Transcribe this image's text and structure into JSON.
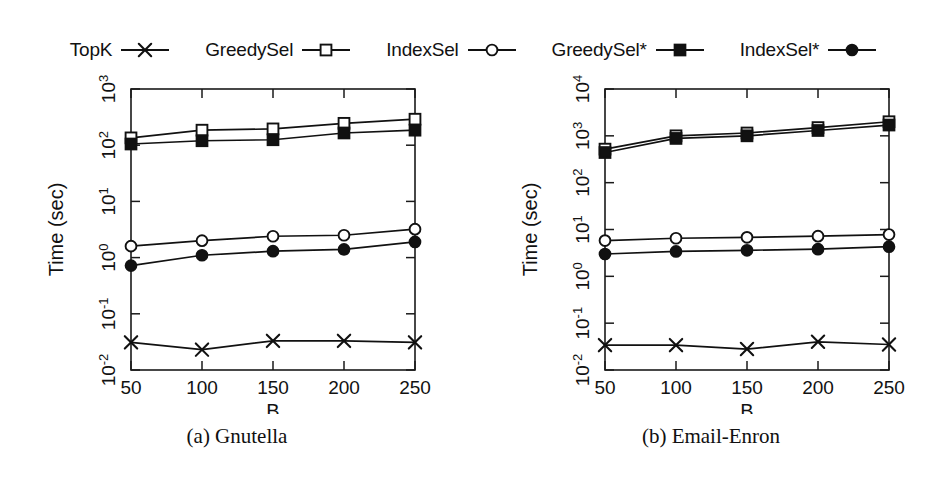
{
  "figure": {
    "background": "#ffffff",
    "ink_color": "#111111"
  },
  "legend": {
    "position": "top",
    "entries": [
      {
        "label": "TopK",
        "marker": "cross",
        "filled": false
      },
      {
        "label": "GreedySel",
        "marker": "square",
        "filled": false
      },
      {
        "label": "IndexSel",
        "marker": "circle",
        "filled": false
      },
      {
        "label": "GreedySel*",
        "marker": "square-solid",
        "filled": true
      },
      {
        "label": "IndexSel*",
        "marker": "circle-solid",
        "filled": true
      }
    ]
  },
  "captions": {
    "left": "(a) Gnutella",
    "right": "(b) Email-Enron"
  },
  "chart_data": [
    {
      "type": "line",
      "panel": "a",
      "title": "(a) Gnutella",
      "xlabel": "B",
      "ylabel": "Time (sec)",
      "xscale": "linear",
      "yscale": "log",
      "grid": false,
      "legend_position": "top",
      "categories": [
        50,
        100,
        150,
        200,
        250
      ],
      "x": [
        50,
        100,
        150,
        200,
        250
      ],
      "xlim": [
        50,
        250
      ],
      "xticks": [
        50,
        100,
        150,
        200,
        250
      ],
      "xticklabels": [
        "50",
        "100",
        "150",
        "200",
        "250"
      ],
      "ylim": [
        0.01,
        1000
      ],
      "yticks": [
        0.01,
        0.1,
        1,
        10,
        100,
        1000
      ],
      "yticklabels": [
        "10-2",
        "10-1",
        "100",
        "101",
        "102",
        "103"
      ],
      "yticklabels_base": [
        "10",
        "10",
        "10",
        "10",
        "10",
        "10"
      ],
      "yticklabels_exp": [
        "-2",
        "-1",
        "0",
        "1",
        "2",
        "3"
      ],
      "series": [
        {
          "name": "TopK",
          "marker": "cross",
          "values": [
            0.031,
            0.023,
            0.033,
            0.033,
            0.031
          ]
        },
        {
          "name": "GreedySel",
          "marker": "square",
          "values": [
            135,
            185,
            195,
            245,
            290
          ]
        },
        {
          "name": "IndexSel",
          "marker": "circle",
          "values": [
            1.6,
            2.0,
            2.4,
            2.5,
            3.2
          ]
        },
        {
          "name": "GreedySel*",
          "marker": "square-solid",
          "values": [
            105,
            120,
            125,
            165,
            185
          ]
        },
        {
          "name": "IndexSel*",
          "marker": "circle-solid",
          "values": [
            0.72,
            1.1,
            1.3,
            1.4,
            1.9
          ]
        }
      ]
    },
    {
      "type": "line",
      "panel": "b",
      "title": "(b) Email-Enron",
      "xlabel": "B",
      "ylabel": "Time (sec)",
      "xscale": "linear",
      "yscale": "log",
      "grid": false,
      "legend_position": "top",
      "categories": [
        50,
        100,
        150,
        200,
        250
      ],
      "x": [
        50,
        100,
        150,
        200,
        250
      ],
      "xlim": [
        50,
        250
      ],
      "xticks": [
        50,
        100,
        150,
        200,
        250
      ],
      "xticklabels": [
        "50",
        "100",
        "150",
        "200",
        "250"
      ],
      "ylim": [
        0.01,
        10000
      ],
      "yticks": [
        0.01,
        0.1,
        1,
        10,
        100,
        1000,
        10000
      ],
      "yticklabels": [
        "10-2",
        "10-1",
        "100",
        "101",
        "102",
        "103",
        "104"
      ],
      "yticklabels_base": [
        "10",
        "10",
        "10",
        "10",
        "10",
        "10",
        "10"
      ],
      "yticklabels_exp": [
        "-2",
        "-1",
        "0",
        "1",
        "2",
        "3",
        "4"
      ],
      "series": [
        {
          "name": "TopK",
          "marker": "cross",
          "values": [
            0.034,
            0.034,
            0.028,
            0.04,
            0.035
          ]
        },
        {
          "name": "GreedySel",
          "marker": "square",
          "values": [
            520,
            1000,
            1150,
            1500,
            2000
          ]
        },
        {
          "name": "IndexSel",
          "marker": "circle",
          "values": [
            5.8,
            6.5,
            6.8,
            7.2,
            7.8
          ]
        },
        {
          "name": "GreedySel*",
          "marker": "square-solid",
          "values": [
            440,
            880,
            1000,
            1300,
            1700
          ]
        },
        {
          "name": "IndexSel*",
          "marker": "circle-solid",
          "values": [
            3.0,
            3.4,
            3.6,
            3.8,
            4.3
          ]
        }
      ]
    }
  ]
}
